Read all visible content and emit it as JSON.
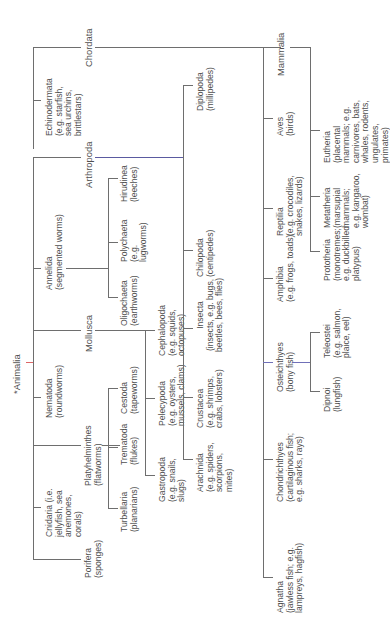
{
  "diagram": {
    "type": "taxonomy-tree",
    "orientation": "rotated-90-ccw",
    "root": {
      "label": "*Animalia",
      "children": [
        {
          "label": "Porifera",
          "sub": "(sponges)"
        },
        {
          "label": "Cnidaria",
          "sub": "(i.e. jellyfish, sea anemones, corals)"
        },
        {
          "label": "Platyhelminthes",
          "sub": "(flatworms)",
          "children": [
            {
              "label": "Turbellaria",
              "sub": "(planarians)"
            },
            {
              "label": "Trematoda",
              "sub": "(flukes)"
            },
            {
              "label": "Cestoda",
              "sub": "(tapeworms)"
            }
          ]
        },
        {
          "label": "Nematoda",
          "sub": "(roundworms)"
        },
        {
          "label": "Mollusca",
          "children": [
            {
              "label": "Gastropoda",
              "sub": "(e.g. snails, slugs)"
            },
            {
              "label": "Pelecypoda",
              "sub": "(e.g. oysters, mussels, clams)"
            },
            {
              "label": "Cephalopoda",
              "sub": "(e.g. squids, octopuses)"
            }
          ]
        },
        {
          "label": "Annelida",
          "sub": "(segmented worms)",
          "children": [
            {
              "label": "Oligochaeta",
              "sub": "(earthworms)"
            },
            {
              "label": "Polychaeta",
              "sub": "(e.g. lugworms)"
            },
            {
              "label": "Hirudinea",
              "sub": "(leeches)"
            }
          ]
        },
        {
          "label": "Arthropoda",
          "children": [
            {
              "label": "Arachnida",
              "sub": "(e.g. spiders, scorpions, mites)"
            },
            {
              "label": "Crustacea",
              "sub": "(e.g. shrimps, crabs, lobsters)"
            },
            {
              "label": "Insecta",
              "sub": "(insects, e.g. bugs, beetles, bees, flies)"
            },
            {
              "label": "Chilopoda",
              "sub": "(centipedes)"
            },
            {
              "label": "Diplopoda",
              "sub": "(millipedes)"
            }
          ]
        },
        {
          "label": "Echinodermata",
          "sub": "(e.g. starfish, sea urchins, brittlestars)"
        },
        {
          "label": "Chordata",
          "children": [
            {
              "label": "Agnatha",
              "sub": "(jawless fish; e.g. lampreys, hagfish)"
            },
            {
              "label": "Chondrichthyes",
              "sub": "(cartilaginous fish; e.g. sharks, rays)"
            },
            {
              "label": "Osteichthyes",
              "sub": "(bony fish)",
              "children": [
                {
                  "label": "Dipnoi",
                  "sub": "(lungfish)"
                },
                {
                  "label": "Teleostei",
                  "sub": "(e.g. salmon, plaice, eel)"
                }
              ]
            },
            {
              "label": "Amphibia",
              "sub": "(e.g. frogs, toads)"
            },
            {
              "label": "Reptilia",
              "sub": "(e.g. crocodiles, snakes, lizards)"
            },
            {
              "label": "Aves",
              "sub": "(birds)"
            },
            {
              "label": "Mammalia",
              "children": [
                {
                  "label": "Prototheria",
                  "sub": "(monotremes; e.g. duckbilled platypus)"
                },
                {
                  "label": "Metatheria",
                  "sub": "(marsupial mammals; e.g. kangaroo, wombat)"
                },
                {
                  "label": "Eutheria",
                  "sub": "(placental mammals; e.g. carnivores, bats, whales, rodents, ungulates, primates)"
                }
              ]
            }
          ]
        }
      ]
    }
  },
  "labels": {
    "animalia": "*Animalia",
    "porifera": "Porifera\n(sponges)",
    "cnidaria": "Cnidaria (i.e.\njellyfish, sea\nanemones,\ncorals)",
    "platyhelminthes": "Platyhelminthes\n(flatworms)",
    "turbellaria": "Turbellaria\n(planarians)",
    "trematoda": "Trematoda\n(flukes)",
    "cestoda": "Cestoda\n(tapeworms)",
    "nematoda": "Nematoda\n(roundworms)",
    "mollusca": "Mollusca",
    "gastropoda": "Gastropoda\n(e.g. snails,\nslugs)",
    "pelecypoda": "Pelecypoda\n(e.g. oysters,\nmussels, clams)",
    "cephalopoda": "Cephalopoda\n(e.g. squids,\noctopuses)",
    "annelida": "Annelida\n(segmented worms)",
    "oligochaeta": "Oligochaeta\n(earthworms)",
    "polychaeta": "Polychaeta\n(e.g.\nlugworms)",
    "hirudinea": "Hirudinea\n(leeches)",
    "arthropoda": "Arthropoda",
    "arachnida": "Arachnida\n(e.g. spiders,\nscorpions,\nmites)",
    "crustacea": "Crustacea\n(e.g. shrimps,\ncrabs, lobsters)",
    "insecta": "Insecta\n(insects, e.g. bugs,\nbeetles, bees, flies)",
    "chilopoda": "Chilopoda\n(centipedes)",
    "diplopoda": "Diplopoda\n(millipedes)",
    "echinodermata": "Echinodermata\n(e.g. starfish,\nsea urchins,\nbrittlestars)",
    "chordata": "Chordata",
    "agnatha": "Agnatha\n(jawless fish; e.g.\nlampreys, hagfish)",
    "chondrichthyes": "Chondrichthyes\n(cartilaginous fish;\ne.g. sharks, rays)",
    "osteichthyes": "Osteichthyes\n(bony fish)",
    "dipnoi": "Dipnoi\n(lungfish)",
    "teleostei": "Teleostei\n(e.g. salmon,\nplaice, eel)",
    "amphibia": "Amphibia\n(e.g. frogs, toads)",
    "reptilia": "Reptilia\n(e.g. crocodiles,\nsnakes, lizards)",
    "aves": "Aves\n(birds)",
    "mammalia": "Mammalia",
    "prototheria": "Prototheria\n(monotremes;\ne.g. duckbilled\nplatypus)",
    "metatheria": "Metatheria\n(marsupial\nmammals;\ne.g. kangaroo,\nwombat)",
    "eutheria": "Eutheria\n(placental\nmammals; e.g.\ncarnivores, bats,\nwhales, rodents,\nungulates,\nprimates)"
  },
  "colors": {
    "line": "#6e6e6e",
    "text": "#4f4f4f",
    "background": "#ffffff"
  }
}
